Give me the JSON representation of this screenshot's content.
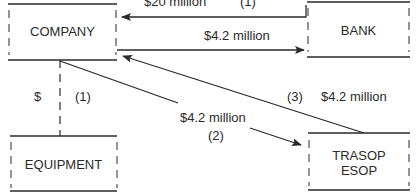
{
  "nodes": {
    "company": {
      "label": "COMPANY"
    },
    "bank": {
      "label": "BANK"
    },
    "equipment": {
      "label": "EQUIPMENT"
    },
    "trasop": {
      "label_line1": "TRASOP",
      "label_line2": "ESOP"
    }
  },
  "edges": {
    "bank_to_company": {
      "amount": "$20 million",
      "step": "(1)"
    },
    "company_to_bank": {
      "amount": "$4.2 million"
    },
    "company_to_equipment": {
      "amount": "$",
      "step": "(1)"
    },
    "company_to_trasop": {
      "amount": "$4.2 million",
      "step": "(2)"
    },
    "trasop_to_company": {
      "amount": "$4.2 million",
      "step": "(3)"
    }
  },
  "colors": {
    "line": "#2a2a2a",
    "background": "#ffffff"
  }
}
